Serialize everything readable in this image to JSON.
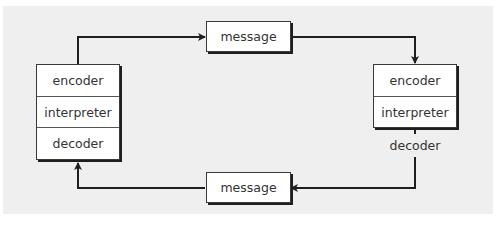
{
  "diagram": {
    "sender": {
      "cells": [
        "encoder",
        "interpreter",
        "decoder"
      ]
    },
    "receiver": {
      "cells": [
        "encoder",
        "interpreter"
      ],
      "outside_label": "decoder"
    },
    "top_message": "message",
    "bottom_message": "message",
    "colors": {
      "panel_background": "#efefef",
      "box_fill": "#ffffff",
      "line": "#1e1e1e",
      "text": "#333333"
    }
  }
}
